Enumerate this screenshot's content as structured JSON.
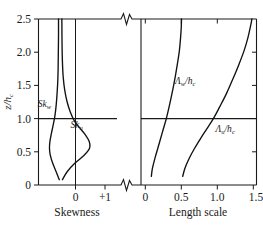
{
  "figure": {
    "title": "",
    "y_axis_label": "z/h",
    "y_axis_label_sub": "c"
  },
  "chart_data": {
    "type": "line",
    "title": "",
    "panels": [
      {
        "name": "skewness-panel",
        "xlabel": "Skewness",
        "ylabel": "z/h_c",
        "xlim": [
          -0.55,
          1.45
        ],
        "ylim": [
          0,
          2.5
        ],
        "xticks": [
          0,
          1
        ],
        "xticklabels": [
          "0",
          "+1"
        ],
        "yticks": [
          0,
          0.5,
          1.0,
          1.5,
          2.0,
          2.5
        ],
        "yticklabels": [
          "0",
          "0.5",
          "1.0",
          "1.5",
          "2.0",
          "2.5"
        ],
        "grid": false,
        "reference_line_y": 1.0,
        "zero_line_x": 0,
        "series": [
          {
            "name": "Sk",
            "subscript": "w",
            "label": "Sk",
            "label_sub": "w",
            "label_x": -0.4,
            "label_y": 1.17,
            "points": [
              [
                -0.02,
                0.08
              ],
              [
                -0.1,
                0.2
              ],
              [
                -0.19,
                0.33
              ],
              [
                -0.25,
                0.45
              ],
              [
                -0.27,
                0.55
              ],
              [
                -0.26,
                0.65
              ],
              [
                -0.22,
                0.78
              ],
              [
                -0.17,
                0.92
              ],
              [
                -0.13,
                1.05
              ],
              [
                -0.1,
                1.2
              ],
              [
                -0.08,
                1.35
              ],
              [
                -0.06,
                1.55
              ],
              [
                -0.05,
                1.75
              ],
              [
                -0.045,
                2.0
              ],
              [
                -0.04,
                2.25
              ],
              [
                -0.04,
                2.5
              ]
            ]
          },
          {
            "name": "Sk",
            "subscript": "u",
            "label": "Sk",
            "label_sub": "u",
            "label_x": 0.42,
            "label_y": 0.86,
            "points": [
              [
                0.06,
                0.08
              ],
              [
                0.18,
                0.2
              ],
              [
                0.38,
                0.33
              ],
              [
                0.6,
                0.44
              ],
              [
                0.72,
                0.52
              ],
              [
                0.76,
                0.58
              ],
              [
                0.74,
                0.66
              ],
              [
                0.64,
                0.76
              ],
              [
                0.5,
                0.86
              ],
              [
                0.36,
                0.97
              ],
              [
                0.26,
                1.1
              ],
              [
                0.18,
                1.25
              ],
              [
                0.12,
                1.42
              ],
              [
                0.08,
                1.62
              ],
              [
                0.06,
                1.85
              ],
              [
                0.05,
                2.1
              ],
              [
                0.045,
                2.5
              ]
            ]
          }
        ]
      },
      {
        "name": "length-scale-panel",
        "xlabel": "Length scale",
        "ylabel": "z/h_c",
        "xlim": [
          -0.06,
          1.56
        ],
        "ylim": [
          0,
          2.5
        ],
        "xticks": [
          0,
          0.5,
          1.0,
          1.5
        ],
        "xticklabels": [
          "0",
          "0.5",
          "1.0",
          "1.5"
        ],
        "grid": false,
        "reference_line_y": 1.0,
        "series": [
          {
            "name": "Lambda",
            "subscript": "w",
            "label": "Λ",
            "label_sub": "w",
            "label_den": "/h",
            "label_den_sub": "c",
            "label_x": 0.56,
            "label_y": 1.52,
            "points": [
              [
                0.085,
                0.13
              ],
              [
                0.1,
                0.25
              ],
              [
                0.135,
                0.4
              ],
              [
                0.175,
                0.55
              ],
              [
                0.215,
                0.7
              ],
              [
                0.255,
                0.85
              ],
              [
                0.295,
                1.0
              ],
              [
                0.335,
                1.18
              ],
              [
                0.375,
                1.38
              ],
              [
                0.415,
                1.6
              ],
              [
                0.45,
                1.82
              ],
              [
                0.478,
                2.02
              ],
              [
                0.495,
                2.22
              ],
              [
                0.505,
                2.38
              ],
              [
                0.508,
                2.5
              ]
            ]
          },
          {
            "name": "Lambda",
            "subscript": "u",
            "label": "Λ",
            "label_sub": "u",
            "label_den": "/h",
            "label_den_sub": "c",
            "label_x": 1.12,
            "label_y": 0.8,
            "points": [
              [
                0.525,
                0.13
              ],
              [
                0.555,
                0.25
              ],
              [
                0.615,
                0.4
              ],
              [
                0.69,
                0.55
              ],
              [
                0.775,
                0.7
              ],
              [
                0.865,
                0.85
              ],
              [
                0.955,
                1.0
              ],
              [
                1.045,
                1.18
              ],
              [
                1.14,
                1.38
              ],
              [
                1.23,
                1.6
              ],
              [
                1.315,
                1.82
              ],
              [
                1.385,
                2.02
              ],
              [
                1.44,
                2.22
              ],
              [
                1.478,
                2.4
              ],
              [
                1.495,
                2.5
              ]
            ]
          }
        ]
      }
    ],
    "axis_break": {
      "present": true,
      "locations": [
        "top-between-panels",
        "bottom-between-panels"
      ],
      "symbol": "zigzag"
    }
  }
}
